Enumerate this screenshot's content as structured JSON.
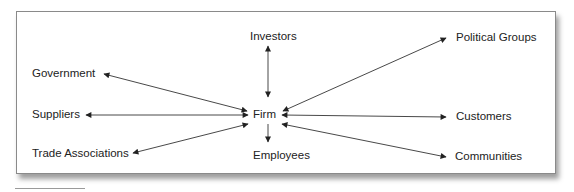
{
  "diagram": {
    "center": {
      "id": "firm",
      "label": "Firm"
    },
    "nodes": [
      {
        "id": "investors",
        "label": "Investors"
      },
      {
        "id": "political-groups",
        "label": "Political Groups"
      },
      {
        "id": "government",
        "label": "Government"
      },
      {
        "id": "suppliers",
        "label": "Suppliers"
      },
      {
        "id": "customers",
        "label": "Customers"
      },
      {
        "id": "trade-associations",
        "label": "Trade Associations"
      },
      {
        "id": "employees",
        "label": "Employees"
      },
      {
        "id": "communities",
        "label": "Communities"
      }
    ],
    "edges": [
      {
        "from": "firm",
        "to": "investors",
        "direction": "bidirectional"
      },
      {
        "from": "firm",
        "to": "political-groups",
        "direction": "bidirectional"
      },
      {
        "from": "firm",
        "to": "government",
        "direction": "bidirectional"
      },
      {
        "from": "firm",
        "to": "suppliers",
        "direction": "bidirectional"
      },
      {
        "from": "firm",
        "to": "customers",
        "direction": "bidirectional"
      },
      {
        "from": "firm",
        "to": "trade-associations",
        "direction": "bidirectional"
      },
      {
        "from": "firm",
        "to": "employees",
        "direction": "to"
      },
      {
        "from": "firm",
        "to": "communities",
        "direction": "bidirectional"
      }
    ],
    "colors": {
      "line": "#333333",
      "text": "#222222",
      "border": "#8a8a8a"
    }
  }
}
